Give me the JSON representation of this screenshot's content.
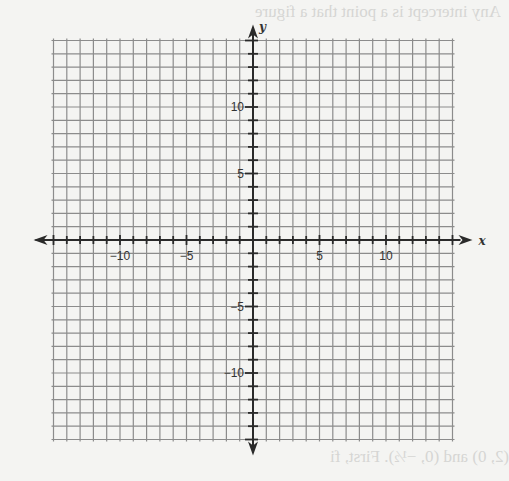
{
  "chart_data": {
    "type": "scatter",
    "title": "",
    "xlabel": "x",
    "ylabel": "y",
    "xlim": [
      -15,
      15
    ],
    "ylim": [
      -15,
      15
    ],
    "grid": true,
    "grid_step": 1,
    "x_ticks": [
      -10,
      -5,
      5,
      10
    ],
    "y_ticks": [
      10,
      5,
      -5,
      -10
    ],
    "x_tick_labels": [
      "−10",
      "−5",
      "5",
      "10"
    ],
    "y_tick_labels": [
      "10",
      "5",
      "−5",
      "−10"
    ],
    "series": [],
    "legend": null
  },
  "bleed_through_text": [
    "Any intercept is a point that a figure",
    "(2, 0) and (0, −½). First, fi"
  ],
  "colors": {
    "grid": "#8c8c8c",
    "axis": "#2a2a2a",
    "paper": "#f4f4f2"
  }
}
